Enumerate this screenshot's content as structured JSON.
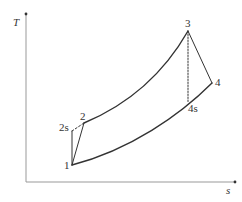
{
  "diagram": {
    "type": "T-s diagram (Brayton cycle)",
    "axes": {
      "y_label": "T",
      "x_label": "s"
    },
    "points": {
      "p1": "1",
      "p2": "2",
      "p2s": "2s",
      "p3": "3",
      "p4": "4",
      "p4s": "4s"
    },
    "colors": {
      "axis": "#888888",
      "curve": "#333333",
      "text": "#333333"
    }
  }
}
